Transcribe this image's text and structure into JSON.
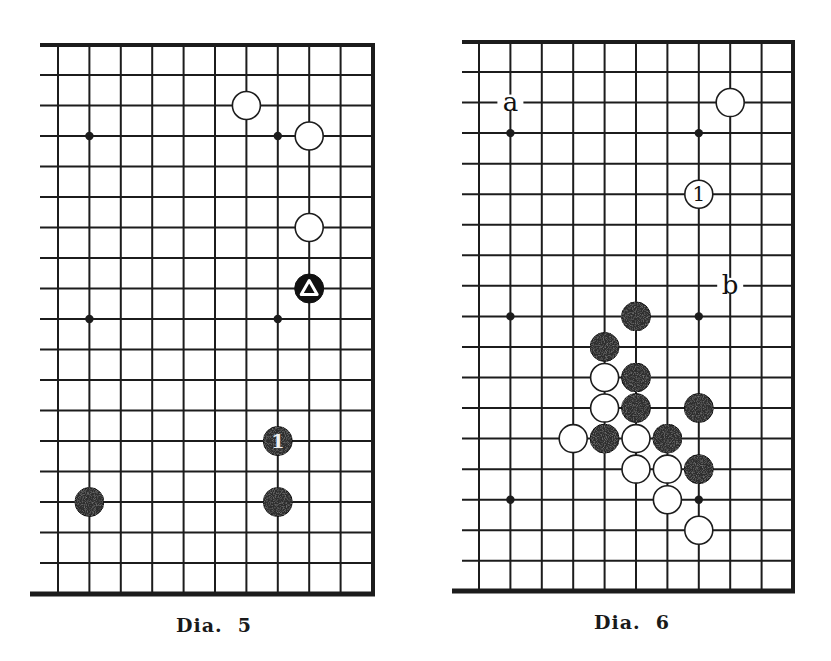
{
  "diagrams": [
    {
      "id": "dia5",
      "caption": "Dia.  5",
      "grid": {
        "x0": 58,
        "dx": 31.4,
        "cols": 10,
        "y0": 75,
        "dy": 30.5,
        "rows": 17,
        "left_open_x": 40,
        "top_border_y": 45,
        "bottom_border_y": 594,
        "right_border_x": 373
      },
      "hoshi": [
        [
          1,
          2
        ],
        [
          7,
          2
        ],
        [
          1,
          8
        ],
        [
          7,
          8
        ]
      ],
      "stones": [
        {
          "color": "white",
          "col": 6,
          "row": 1
        },
        {
          "color": "white",
          "col": 8,
          "row": 2
        },
        {
          "color": "white",
          "col": 8,
          "row": 5
        },
        {
          "color": "black",
          "col": 8,
          "row": 7,
          "mark": "triangle"
        },
        {
          "color": "black",
          "col": 7,
          "row": 12,
          "label": "1"
        },
        {
          "color": "black",
          "col": 1,
          "row": 14
        },
        {
          "color": "black",
          "col": 7,
          "row": 14
        }
      ],
      "letters": []
    },
    {
      "id": "dia6",
      "caption": "Dia.  6",
      "grid": {
        "x0": 479,
        "dx": 31.4,
        "cols": 10,
        "y0": 72,
        "dy": 30.55,
        "rows": 17,
        "left_open_x": 462,
        "top_border_y": 42,
        "bottom_border_y": 591,
        "right_border_x": 793
      },
      "hoshi": [
        [
          1,
          2
        ],
        [
          7,
          2
        ],
        [
          1,
          8
        ],
        [
          7,
          8
        ],
        [
          1,
          14
        ],
        [
          7,
          14
        ]
      ],
      "stones": [
        {
          "color": "white",
          "col": 8,
          "row": 1
        },
        {
          "color": "white",
          "col": 7,
          "row": 4,
          "label": "1"
        },
        {
          "color": "black",
          "col": 5,
          "row": 8
        },
        {
          "color": "black",
          "col": 4,
          "row": 9
        },
        {
          "color": "white",
          "col": 4,
          "row": 10
        },
        {
          "color": "black",
          "col": 5,
          "row": 10
        },
        {
          "color": "white",
          "col": 4,
          "row": 11
        },
        {
          "color": "black",
          "col": 5,
          "row": 11
        },
        {
          "color": "black",
          "col": 7,
          "row": 11
        },
        {
          "color": "white",
          "col": 3,
          "row": 12
        },
        {
          "color": "black",
          "col": 4,
          "row": 12
        },
        {
          "color": "white",
          "col": 5,
          "row": 12
        },
        {
          "color": "black",
          "col": 6,
          "row": 12
        },
        {
          "color": "white",
          "col": 5,
          "row": 13
        },
        {
          "color": "white",
          "col": 6,
          "row": 13
        },
        {
          "color": "black",
          "col": 7,
          "row": 13
        },
        {
          "color": "white",
          "col": 6,
          "row": 14
        },
        {
          "color": "white",
          "col": 7,
          "row": 15
        }
      ],
      "letters": [
        {
          "text": "a",
          "col": 1,
          "row": 1
        },
        {
          "text": "b",
          "col": 8,
          "row": 7
        }
      ]
    }
  ],
  "colors": {
    "line": "#1c1c1c",
    "black_stone": "#2e2e2e",
    "white_stone": "#ffffff",
    "background": "#ffffff"
  }
}
